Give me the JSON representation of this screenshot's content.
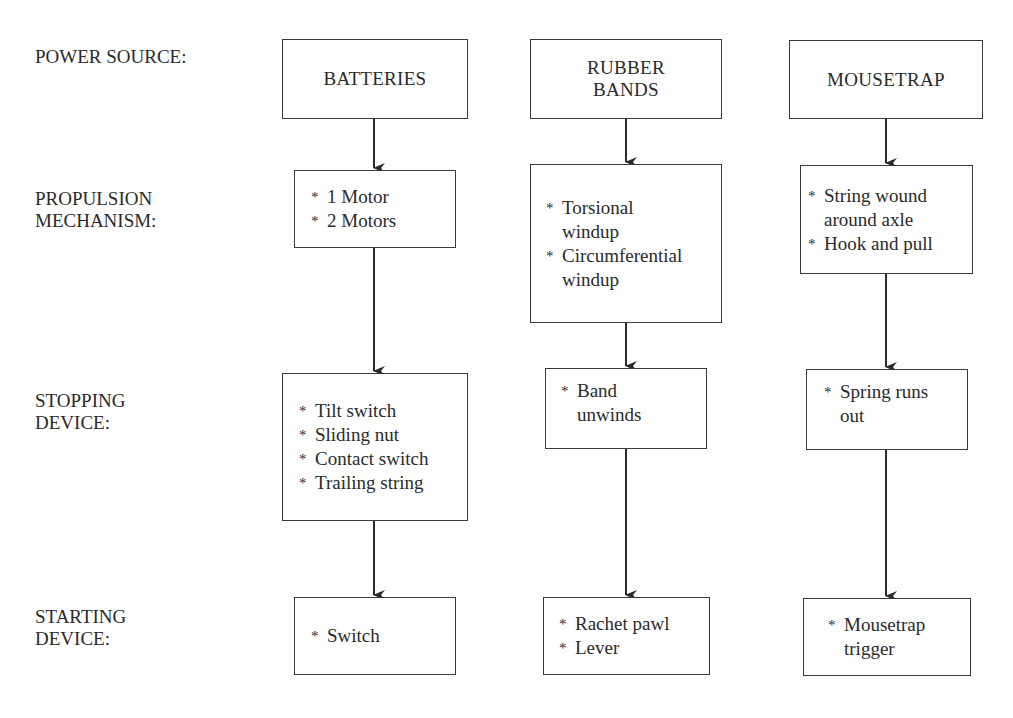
{
  "diagram": {
    "row_labels": [
      "POWER SOURCE:",
      "PROPULSION\nMECHANISM:",
      "STOPPING\nDEVICE:",
      "STARTING\nDEVICE:"
    ],
    "columns": [
      {
        "power_source": "BATTERIES",
        "propulsion": [
          "1 Motor",
          "2 Motors"
        ],
        "stopping": [
          "Tilt switch",
          "Sliding nut",
          "Contact switch",
          "Trailing string"
        ],
        "starting": [
          "Switch"
        ]
      },
      {
        "power_source": "RUBBER\nBANDS",
        "propulsion": [
          "Torsional\nwindup",
          "Circumferential\nwindup"
        ],
        "stopping": [
          "Band\nunwinds"
        ],
        "starting": [
          "Rachet pawl",
          "Lever"
        ]
      },
      {
        "power_source": "MOUSETRAP",
        "propulsion": [
          "String wound\naround axle",
          "Hook and pull"
        ],
        "stopping": [
          "Spring runs\nout"
        ],
        "starting": [
          "Mousetrap\ntrigger"
        ]
      }
    ],
    "bullet_symbol": "*",
    "colors": {
      "line": "#2a2a2a",
      "text": "#2a2a2a",
      "background": "#ffffff"
    }
  }
}
